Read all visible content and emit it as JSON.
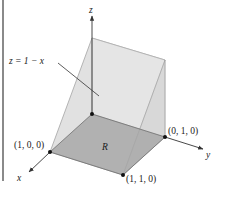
{
  "figure": {
    "surface_label": "z = 1 − x",
    "region_label": "R",
    "axes": {
      "x": "x",
      "y": "y",
      "z": "z"
    },
    "points": [
      {
        "id": "p100",
        "label": "(1, 0, 0)"
      },
      {
        "id": "p010",
        "label": "(0, 1, 0)"
      },
      {
        "id": "p110",
        "label": "(1, 1, 0)"
      }
    ],
    "colors": {
      "base_region": "#a9a9a9",
      "wedge_face": "#dcdcdc",
      "side_face": "#c9c9c9",
      "edge": "#7a7a7a",
      "axis": "#333333",
      "left_bar": "#8a8a8a"
    }
  }
}
